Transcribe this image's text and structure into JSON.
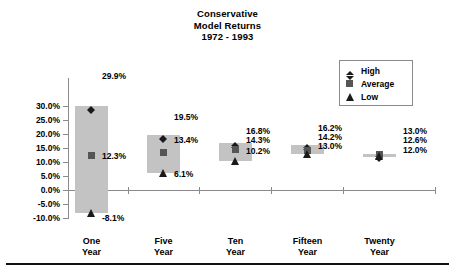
{
  "chart_data": {
    "type": "bar",
    "title": "Conservative Model Returns 1972 - 1993",
    "title_lines": [
      "Conservative",
      "Model Returns",
      "1972 - 1993"
    ],
    "xlabel": "",
    "ylabel": "",
    "ylim": [
      -10,
      30
    ],
    "grid": false,
    "legend_position": "top-right",
    "ytick_labels": [
      "30.0%",
      "25.0%",
      "20.0%",
      "15.0%",
      "10.0%",
      "5.0%",
      "0.0%",
      "-5.0%",
      "-10.0%"
    ],
    "ytick_values": [
      30,
      25,
      20,
      15,
      10,
      5,
      0,
      -5,
      -10
    ],
    "categories": [
      "One Year",
      "Five Year",
      "Ten Year",
      "Fifteen Year",
      "Twenty Year"
    ],
    "category_lines": [
      [
        "One",
        "Year"
      ],
      [
        "Five",
        "Year"
      ],
      [
        "Ten",
        "Year"
      ],
      [
        "Fifteen",
        "Year"
      ],
      [
        "Twenty",
        "Year"
      ]
    ],
    "series": [
      {
        "name": "High",
        "marker": "diamond",
        "values": [
          29.9,
          19.5,
          16.8,
          16.2,
          13.0
        ],
        "labels": [
          "29.9%",
          "19.5%",
          "16.8%",
          "16.2%",
          "13.0%"
        ]
      },
      {
        "name": "Average",
        "marker": "square",
        "values": [
          12.3,
          13.4,
          14.3,
          14.2,
          12.6
        ],
        "labels": [
          "12.3%",
          "13.4%",
          "14.3%",
          "14.2%",
          "12.6%"
        ]
      },
      {
        "name": "Low",
        "marker": "triangle",
        "values": [
          -8.1,
          6.1,
          10.2,
          13.0,
          12.0
        ],
        "labels": [
          "-8.1%",
          "6.1%",
          "10.2%",
          "13.0%",
          "12.0%"
        ]
      }
    ],
    "colors": {
      "bar_fill": "#c3c3c3",
      "high_marker": "#1a1a1a",
      "average_marker": "#555555",
      "low_marker": "#1a1a1a",
      "axis": "#8a8a8a",
      "text": "#000000",
      "background": "#ffffff"
    }
  },
  "legend": {
    "items": [
      {
        "label": "High",
        "marker": "diamond"
      },
      {
        "label": "Average",
        "marker": "square"
      },
      {
        "label": "Low",
        "marker": "triangle"
      }
    ]
  }
}
